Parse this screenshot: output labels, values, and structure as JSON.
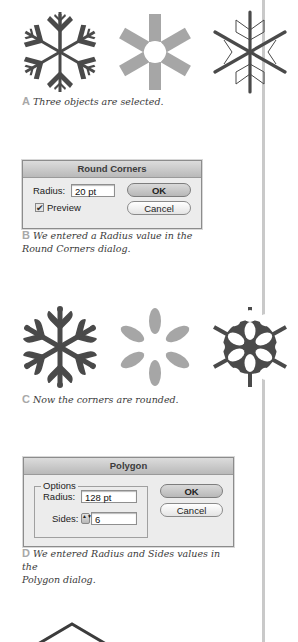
{
  "figures": [
    {
      "letter": "A",
      "caption": "Three objects are selected."
    },
    {
      "letter": "B",
      "caption_line1": "We entered a Radius value in the",
      "caption_line2": "Round Corners dialog."
    },
    {
      "letter": "C",
      "caption": "Now the corners are rounded."
    },
    {
      "letter": "D",
      "caption_line1": "We entered Radius and Sides values in the",
      "caption_line2": "Polygon dialog."
    }
  ],
  "round_corners_dialog": {
    "title": "Round Corners",
    "radius_label": "Radius:",
    "radius_value": "20 pt",
    "preview_label": "Preview",
    "preview_checked": "✔",
    "ok_label": "OK",
    "cancel_label": "Cancel"
  },
  "polygon_dialog": {
    "title": "Polygon",
    "group_label": "Options",
    "radius_label": "Radius:",
    "radius_value": "128 pt",
    "sides_label": "Sides:",
    "sides_value": "6",
    "stepper_glyph": "▲▼",
    "ok_label": "OK",
    "cancel_label": "Cancel"
  },
  "colors": {
    "dark_shape": "#4a4a4a",
    "gray_shape": "#a6a6a6",
    "caption_letter": "#a8a8a8",
    "divider": "#c9c9c9"
  }
}
